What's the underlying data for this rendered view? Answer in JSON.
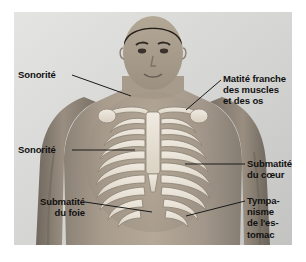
{
  "figure": {
    "type": "anatomical-diagram",
    "background_color": "#ffffff",
    "photo_background_color": "#d9d9d9",
    "skin_color": "#9c9083",
    "bone_color": "#efe9df",
    "text_color": "#111111",
    "leader_color": "#1a1a1a"
  },
  "labels": [
    {
      "id": "sonorite-upper",
      "text": "Sonorité",
      "align": "left",
      "x": 18,
      "y": 69,
      "leader": {
        "x1": 72,
        "y1": 75,
        "x2": 131,
        "y2": 96
      }
    },
    {
      "id": "matite-franche",
      "text": "Matité franche\ndes muscles\net des os",
      "align": "left",
      "x": 223,
      "y": 73,
      "leader": {
        "x1": 221,
        "y1": 80,
        "x2": 186,
        "y2": 110
      }
    },
    {
      "id": "sonorite-lower",
      "text": "Sonorité",
      "align": "left",
      "x": 18,
      "y": 144,
      "leader": {
        "x1": 72,
        "y1": 150,
        "x2": 135,
        "y2": 150
      }
    },
    {
      "id": "submatite-coeur",
      "text": "Submatité\ndu cœur",
      "align": "left",
      "x": 247,
      "y": 158,
      "leader": {
        "x1": 245,
        "y1": 164,
        "x2": 185,
        "y2": 164
      }
    },
    {
      "id": "submatite-foie",
      "text": "Submatité\ndu foie",
      "align": "right",
      "x": 13,
      "y": 196,
      "leader": {
        "x1": 85,
        "y1": 202,
        "x2": 152,
        "y2": 212
      }
    },
    {
      "id": "tympanisme-estomac",
      "text": "Tympa-\nnisme\nde l'es-\ntomac",
      "align": "left",
      "x": 247,
      "y": 195,
      "leader": {
        "x1": 245,
        "y1": 201,
        "x2": 186,
        "y2": 216
      }
    }
  ]
}
